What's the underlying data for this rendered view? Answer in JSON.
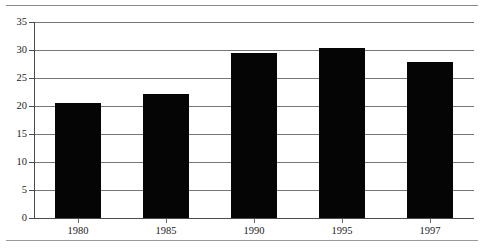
{
  "chart_data": {
    "type": "bar",
    "title": "",
    "subtitle": "",
    "xlabel": "",
    "ylabel": "",
    "categories": [
      "1980",
      "1985",
      "1990",
      "1995",
      "1997"
    ],
    "values": [
      20.5,
      22.2,
      29.4,
      30.3,
      27.9
    ],
    "series": [
      {
        "name": "",
        "values": [
          20.5,
          22.2,
          29.4,
          30.3,
          27.9
        ]
      }
    ],
    "ylim": [
      0,
      35
    ],
    "xlim": [
      0,
      5
    ],
    "y_ticks": [
      0,
      5,
      10,
      15,
      20,
      25,
      30,
      35
    ],
    "y_tick_labels": [
      "0",
      "5",
      "10",
      "15",
      "20",
      "25",
      "30",
      "35"
    ],
    "x_tick_labels": [
      "1980",
      "1985",
      "1990",
      "1995",
      "1997"
    ],
    "grid": true,
    "grid_axis": "y",
    "legend": false,
    "legend_position": "none",
    "bar_color": "#050505",
    "grid_color": "#77777a",
    "axis_color": "#4b4b4d",
    "text_color": "#1b1b1b",
    "background_color": "#ffffff",
    "annotations": []
  },
  "decor": {
    "top_cutoff_text": "",
    "top_rule": true,
    "bottom_rule": true
  }
}
